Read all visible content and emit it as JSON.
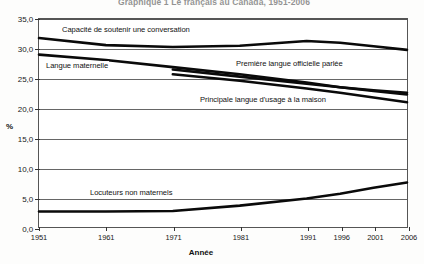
{
  "title": "Graphique 1 Le français au Canada, 1951-2006",
  "axis": {
    "y_title": "%",
    "x_title": "Année",
    "y_ticks": [
      "0,0",
      "5,0",
      "10,0",
      "15,0",
      "20,0",
      "25,0",
      "30,0",
      "35,0"
    ],
    "x_ticks": [
      "1951",
      "1961",
      "1971",
      "1981",
      "1991",
      "1996",
      "2001",
      "2006"
    ]
  },
  "labels": {
    "conversation": "Capacité de soutenir une conversation",
    "maternelle": "Langue maternelle",
    "officielle": "Première langue officielle parlée",
    "maison": "Principale langue d'usage à la maison",
    "locuteurs": "Locuteurs non maternels"
  },
  "chart_data": {
    "type": "line",
    "title": "Graphique 1 Le français au Canada, 1951-2006",
    "xlabel": "Année",
    "ylabel": "%",
    "ylim": [
      0.0,
      35.0
    ],
    "ytick_step": 5.0,
    "grid": true,
    "legend": "in-plot labels",
    "x": [
      1951,
      1961,
      1971,
      1981,
      1991,
      1996,
      2001,
      2006
    ],
    "series": [
      {
        "name": "Capacité de soutenir une conversation",
        "values": [
          31.8,
          30.6,
          30.3,
          30.5,
          31.3,
          31.0,
          30.4,
          29.8
        ]
      },
      {
        "name": "Langue maternelle",
        "values": [
          29.0,
          28.1,
          26.9,
          25.7,
          24.3,
          23.5,
          22.9,
          22.3
        ]
      },
      {
        "name": "Première langue officielle parlée",
        "values": [
          null,
          null,
          26.5,
          25.3,
          24.1,
          23.5,
          23.0,
          22.6
        ]
      },
      {
        "name": "Principale langue d'usage à la maison",
        "values": [
          null,
          null,
          25.7,
          24.6,
          23.3,
          22.6,
          21.8,
          21.0
        ]
      },
      {
        "name": "Locuteurs non maternels",
        "values": [
          2.6,
          2.6,
          2.7,
          3.6,
          4.8,
          5.6,
          6.6,
          7.5
        ]
      }
    ]
  }
}
